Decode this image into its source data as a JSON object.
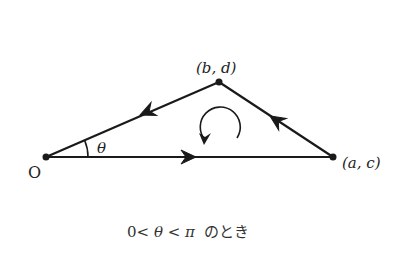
{
  "diagram": {
    "type": "oriented-triangle",
    "colors": {
      "stroke": "#1a1a1a",
      "text": "#222222"
    },
    "points": {
      "origin": {
        "label": "O",
        "x": 46,
        "y": 157
      },
      "p_bd": {
        "label": "(b, d)",
        "x": 219,
        "y": 82
      },
      "p_ac": {
        "label": "(a, c)",
        "x": 333,
        "y": 157
      }
    },
    "angle_label": "θ",
    "rotation": "counterclockwise",
    "edges": [
      {
        "from": "origin",
        "to": "p_ac",
        "direction": "right"
      },
      {
        "from": "p_ac",
        "to": "p_bd",
        "direction": "up-left"
      },
      {
        "from": "p_bd",
        "to": "origin",
        "direction": "down-left"
      }
    ],
    "caption": "0< θ< π のとき"
  },
  "labels": {
    "origin": "O",
    "bd": "(b, d)",
    "ac": "(a, c)",
    "theta": "θ",
    "caption_prefix": "0<",
    "caption_theta": "θ",
    "caption_mid": "<",
    "caption_pi": "π",
    "caption_suffix": "のとき"
  }
}
